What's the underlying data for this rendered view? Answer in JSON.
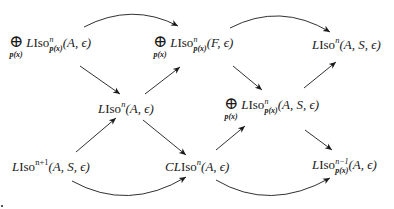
{
  "diagram": {
    "type": "commutative-diagram",
    "stroke_color": "#1a1a1a",
    "nodes": [
      {
        "id": "n1",
        "bigop": "⊕",
        "bigop_sub": "p(x)",
        "name": "LIso",
        "sup": "n",
        "sub": "p(x)",
        "args": "(A, ϵ)"
      },
      {
        "id": "n2",
        "bigop": "⊕",
        "bigop_sub": "p(x)",
        "name": "LIso",
        "sup": "n",
        "sub": "p(x)",
        "args": "(F, ϵ)"
      },
      {
        "id": "n3",
        "name": "LIso",
        "sup": "n",
        "args": "(A, S, ϵ)"
      },
      {
        "id": "n4",
        "name": "LIso",
        "sup": "n",
        "args": "(A, ϵ)"
      },
      {
        "id": "n5",
        "bigop": "⊕",
        "bigop_sub": "p(x)",
        "name": "LIso",
        "sup": "n",
        "sub": "p(x)",
        "args": "(A, S, ϵ)"
      },
      {
        "id": "n6",
        "name": "LIso",
        "sup": "n+1",
        "args": "(A, S, ϵ)"
      },
      {
        "id": "n7",
        "prefix": "C",
        "name": "LIso",
        "sup": "n",
        "args": "(A, ϵ)"
      },
      {
        "id": "n8",
        "name": "LIso",
        "sup": "n−1",
        "sub": "p(x)",
        "args": "(A, ϵ)"
      }
    ],
    "edges": [
      {
        "from": "n1",
        "to": "n2",
        "style": "curved-up"
      },
      {
        "from": "n2",
        "to": "n3",
        "style": "curved-up"
      },
      {
        "from": "n1",
        "to": "n4",
        "style": "straight"
      },
      {
        "from": "n4",
        "to": "n2",
        "style": "straight"
      },
      {
        "from": "n2",
        "to": "n5",
        "style": "straight"
      },
      {
        "from": "n5",
        "to": "n3",
        "style": "straight"
      },
      {
        "from": "n6",
        "to": "n4",
        "style": "straight"
      },
      {
        "from": "n4",
        "to": "n7",
        "style": "straight"
      },
      {
        "from": "n7",
        "to": "n5",
        "style": "straight"
      },
      {
        "from": "n5",
        "to": "n8",
        "style": "straight"
      },
      {
        "from": "n6",
        "to": "n7",
        "style": "curved-down"
      },
      {
        "from": "n7",
        "to": "n8",
        "style": "curved-down"
      }
    ]
  }
}
